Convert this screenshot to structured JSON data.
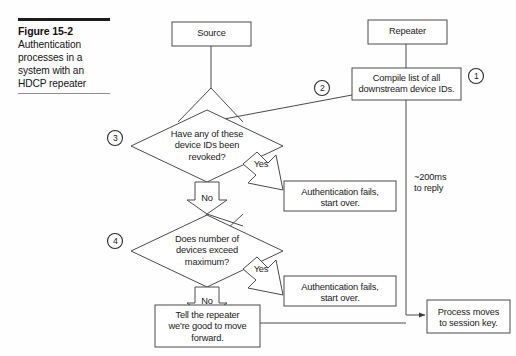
{
  "caption": {
    "figure_number": "Figure 15-2",
    "description": "Authentication processes in a system with an HDCP repeater"
  },
  "diagram": {
    "type": "flowchart",
    "nodes": {
      "source": {
        "label": "Source",
        "shape": "box"
      },
      "repeater": {
        "label": "Repeater",
        "shape": "box"
      },
      "compile": {
        "label": "Compile list of all\ndownstream device IDs.",
        "shape": "box"
      },
      "decision_revoked": {
        "label": "Have any of these\ndevice IDs been\nrevoked?",
        "shape": "diamond"
      },
      "decision_maximum": {
        "label": "Does number of\ndevices exceed\nmaximum?",
        "shape": "diamond"
      },
      "auth_fail_1": {
        "label": "Authentication fails,\nstart over.",
        "shape": "box"
      },
      "auth_fail_2": {
        "label": "Authentication fails,\nstart over.",
        "shape": "box"
      },
      "tell_repeater": {
        "label": "Tell the repeater\nwe're good to move\nforward.",
        "shape": "box"
      },
      "session_key": {
        "label": "Process moves\nto session key.",
        "shape": "box"
      }
    },
    "branch_labels": {
      "yes_1": "Yes",
      "no_1": "No",
      "yes_2": "Yes",
      "no_2": "No"
    },
    "annotations": {
      "timing": "~200ms\nto reply"
    },
    "step_markers": [
      {
        "id": "step-1",
        "label": "1"
      },
      {
        "id": "step-2",
        "label": "2"
      },
      {
        "id": "step-3",
        "label": "3"
      },
      {
        "id": "step-4",
        "label": "4"
      }
    ],
    "colors": {
      "stroke": "#4a4a4a",
      "text": "#1a1a1a",
      "background": "#fefefe",
      "caption_rule": "#1b1b1b"
    }
  }
}
